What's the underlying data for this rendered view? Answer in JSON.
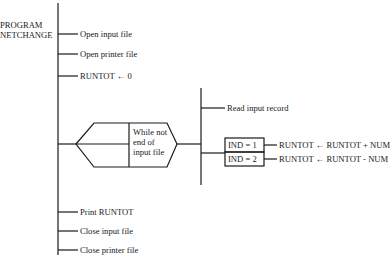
{
  "program": {
    "name_line1": "PROGRAM",
    "name_line2": "NETCHANGE"
  },
  "steps": [
    {
      "label": "Open input file"
    },
    {
      "label": "Open printer file"
    },
    {
      "label": "RUNTOT ← 0"
    },
    {
      "label": "Print RUNTOT"
    },
    {
      "label": "Close input file"
    },
    {
      "label": "Close printer file"
    }
  ],
  "loop": {
    "condition_line1": "While not",
    "condition_line2": "end of",
    "condition_line3": "input file",
    "body": {
      "read": "Read input record",
      "cases": [
        {
          "condition": "IND = 1",
          "action": "RUNTOT ← RUNTOT + NUM"
        },
        {
          "condition": "IND = 2",
          "action": "RUNTOT ← RUNTOT - NUM"
        }
      ]
    }
  },
  "colors": {
    "line": "#1a1a1a",
    "background": "#ffffff"
  }
}
